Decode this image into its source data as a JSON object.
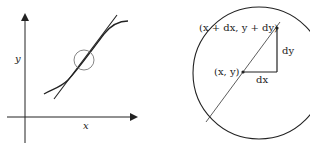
{
  "left_panel": {
    "x_axis_label": "x",
    "y_axis_label": "y"
  },
  "right_panel": {
    "point_label": "(x, y)",
    "neighbor_point_label": "(x + dx, y + dy)",
    "dx_label": "dx",
    "dy_label": "dy"
  },
  "colors": {
    "stroke": "#222222",
    "thin_stroke": "#555555"
  }
}
